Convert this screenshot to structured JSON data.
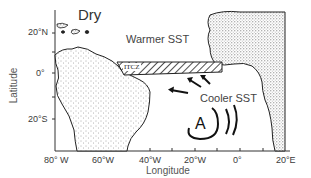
{
  "figure": {
    "region_labels": {
      "dry": "Dry",
      "warmer_sst": "Warmer SST",
      "cooler_sst": "Cooler SST",
      "itcz": "ITCZ",
      "anticyclone": "A"
    },
    "y_axis": {
      "title": "Latitude",
      "ticks": [
        "20°N",
        "0°",
        "20°S"
      ]
    },
    "x_axis": {
      "title": "Longitude",
      "ticks": [
        "80° W",
        "60°W",
        "40°W",
        "20°W",
        "0°",
        "20°E"
      ]
    }
  }
}
